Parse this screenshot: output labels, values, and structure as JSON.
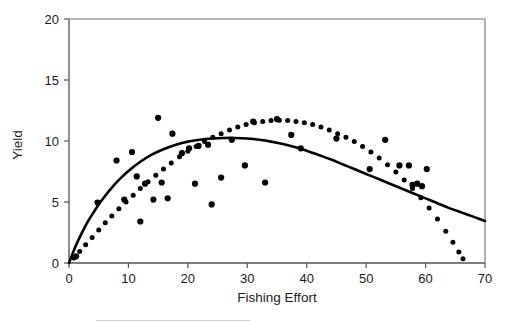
{
  "chart_data": {
    "type": "scatter",
    "title": "",
    "xlabel": "Fishing Effort",
    "ylabel": "Yield",
    "xlim": [
      0,
      70
    ],
    "ylim": [
      0,
      20
    ],
    "xticks": [
      0,
      10,
      20,
      30,
      40,
      50,
      60,
      70
    ],
    "yticks": [
      0,
      5,
      10,
      15,
      20
    ],
    "xtick_labels": [
      "0",
      "10",
      "20",
      "30",
      "40",
      "50",
      "60",
      "70"
    ],
    "ytick_labels": [
      "0",
      "5",
      "10",
      "15",
      "20"
    ],
    "grid": false,
    "legend": "none",
    "frame": "box",
    "series": [
      {
        "name": "fitted-yield-curve",
        "style": "solid-line",
        "color": "#000000",
        "description": "Solid asymmetric surplus-production curve rising steeply from origin, peaking near effort 28 at yield 10.2 and declining to about 3.5 at effort 70",
        "x": [
          0,
          1,
          2,
          3,
          4,
          5,
          6,
          7,
          8,
          9,
          10,
          12,
          14,
          16,
          18,
          20,
          22,
          24,
          26,
          28,
          30,
          32,
          34,
          36,
          38,
          40,
          42,
          44,
          46,
          48,
          50,
          52,
          54,
          56,
          58,
          60,
          62,
          64,
          66,
          68,
          70
        ],
        "y": [
          0.0,
          1.25,
          2.3,
          3.25,
          4.05,
          4.8,
          5.45,
          6.05,
          6.6,
          7.1,
          7.55,
          8.3,
          8.9,
          9.35,
          9.7,
          9.95,
          10.1,
          10.2,
          10.25,
          10.25,
          10.2,
          10.1,
          9.95,
          9.75,
          9.5,
          9.2,
          8.85,
          8.5,
          8.1,
          7.7,
          7.3,
          6.9,
          6.5,
          6.1,
          5.7,
          5.3,
          4.9,
          4.5,
          4.15,
          3.8,
          3.45
        ]
      },
      {
        "name": "dotted-yield-curve",
        "style": "dotted-line",
        "color": "#000000",
        "description": "Dotted parabolic curve rising from origin, peaking near effort 34 at yield 11.7 and falling to zero near effort 66",
        "x": [
          0.8,
          1.8,
          2.8,
          3.9,
          5.0,
          6.1,
          7.2,
          8.4,
          9.6,
          10.8,
          12.0,
          13.3,
          14.6,
          15.9,
          17.2,
          18.6,
          20.0,
          21.4,
          22.8,
          24.2,
          25.6,
          27.0,
          28.4,
          29.8,
          31.2,
          32.6,
          34.0,
          35.4,
          36.8,
          38.2,
          39.6,
          41.0,
          42.4,
          43.8,
          45.2,
          46.6,
          48.0,
          49.4,
          50.8,
          52.2,
          53.6,
          55.0,
          56.4,
          57.8,
          59.2,
          60.6,
          62.0,
          63.4,
          64.6,
          65.6,
          66.3
        ],
        "y": [
          0.4,
          0.95,
          1.5,
          2.1,
          2.7,
          3.3,
          3.85,
          4.45,
          5.0,
          5.55,
          6.1,
          6.65,
          7.2,
          7.7,
          8.2,
          8.7,
          9.15,
          9.55,
          9.95,
          10.3,
          10.6,
          10.9,
          11.15,
          11.35,
          11.5,
          11.6,
          11.68,
          11.7,
          11.68,
          11.6,
          11.5,
          11.35,
          11.15,
          10.9,
          10.6,
          10.3,
          9.95,
          9.55,
          9.1,
          8.6,
          8.05,
          7.45,
          6.8,
          6.1,
          5.35,
          4.5,
          3.6,
          2.6,
          1.7,
          0.9,
          0.35
        ]
      },
      {
        "name": "observed-data-points",
        "style": "scatter-markers",
        "color": "#000000",
        "description": "Individual observed yield-versus-effort observations scattered about the fitted curves",
        "points": [
          [
            1.2,
            0.55
          ],
          [
            4.8,
            4.95
          ],
          [
            8.0,
            8.4
          ],
          [
            9.3,
            5.2
          ],
          [
            10.6,
            9.1
          ],
          [
            11.4,
            7.1
          ],
          [
            12.0,
            3.4
          ],
          [
            12.8,
            6.5
          ],
          [
            14.2,
            5.2
          ],
          [
            15.0,
            11.9
          ],
          [
            15.6,
            6.6
          ],
          [
            16.6,
            5.3
          ],
          [
            17.4,
            10.6
          ],
          [
            19.0,
            9.0
          ],
          [
            20.2,
            9.4
          ],
          [
            21.2,
            6.5
          ],
          [
            21.8,
            9.6
          ],
          [
            23.4,
            9.7
          ],
          [
            24.0,
            4.8
          ],
          [
            25.6,
            7.0
          ],
          [
            27.4,
            10.1
          ],
          [
            29.6,
            8.0
          ],
          [
            31.0,
            11.6
          ],
          [
            33.0,
            6.6
          ],
          [
            35.0,
            11.8
          ],
          [
            37.4,
            10.5
          ],
          [
            39.0,
            9.4
          ],
          [
            45.0,
            10.2
          ],
          [
            50.6,
            7.7
          ],
          [
            53.2,
            10.1
          ],
          [
            55.6,
            8.0
          ],
          [
            57.2,
            8.0
          ],
          [
            57.8,
            6.4
          ],
          [
            58.6,
            6.5
          ],
          [
            59.4,
            6.3
          ],
          [
            60.2,
            7.7
          ]
        ]
      }
    ]
  },
  "axes": {
    "x_title": "Fishing Effort",
    "y_title": "Yield"
  }
}
